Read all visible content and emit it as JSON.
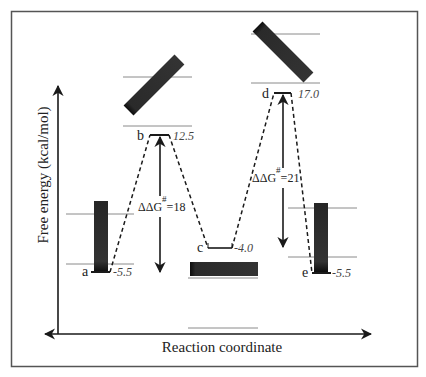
{
  "diagram": {
    "axes": {
      "y_label": "Free energy (kcal/mol)",
      "x_label": "Reaction coordinate"
    },
    "states": [
      {
        "id": "a",
        "label": "a",
        "energy": "-5.5"
      },
      {
        "id": "b",
        "label": "b",
        "energy": "12.5"
      },
      {
        "id": "c",
        "label": "c",
        "energy": "-4.0"
      },
      {
        "id": "d",
        "label": "d",
        "energy": "17.0"
      },
      {
        "id": "e",
        "label": "e",
        "energy": "-5.5"
      }
    ],
    "barriers": [
      {
        "symbol": "ΔΔG",
        "superscript": "#",
        "value": "=18",
        "from": "a",
        "to": "b"
      },
      {
        "symbol": "ΔΔG",
        "superscript": "#",
        "value": "=21",
        "from": "c",
        "to": "d"
      }
    ],
    "colors": {
      "frame": "#555555",
      "bar": "#2b2b2b",
      "bar_end": "#111111",
      "guide_line": "#8a8a8a",
      "axis": "#1a1a1a"
    }
  }
}
